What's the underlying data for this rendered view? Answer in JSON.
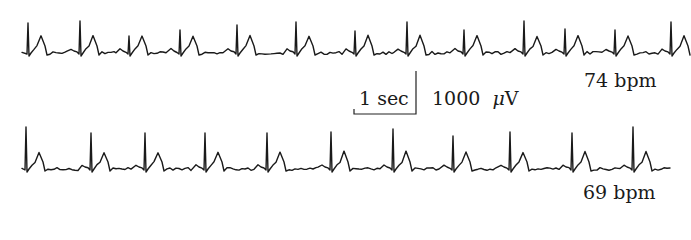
{
  "chart_data": {
    "type": "line",
    "title": "",
    "xlabel": "",
    "ylabel": "",
    "grid": false,
    "legend": null,
    "scale_bar": {
      "time_label": "1 sec",
      "amplitude_label": "1000 μV",
      "time_value": 1,
      "time_unit": "sec",
      "amplitude_value": 1000,
      "amplitude_unit": "μV"
    },
    "series": [
      {
        "name": "top trace",
        "heart_rate_label": "74 bpm",
        "heart_rate_bpm": 74,
        "baseline_y_px": 52,
        "x_range_px": [
          22,
          672
        ],
        "r_peaks_px": [
          {
            "x": 28,
            "y": 23
          },
          {
            "x": 80,
            "y": 21
          },
          {
            "x": 129,
            "y": 36
          },
          {
            "x": 180,
            "y": 30
          },
          {
            "x": 237,
            "y": 25
          },
          {
            "x": 296,
            "y": 22
          },
          {
            "x": 355,
            "y": 31
          },
          {
            "x": 407,
            "y": 22
          },
          {
            "x": 464,
            "y": 30
          },
          {
            "x": 524,
            "y": 21
          },
          {
            "x": 565,
            "y": 29
          },
          {
            "x": 615,
            "y": 30
          },
          {
            "x": 671,
            "y": 22
          }
        ]
      },
      {
        "name": "bottom trace",
        "heart_rate_label": "69 bpm",
        "heart_rate_bpm": 69,
        "baseline_y_px": 168,
        "x_range_px": [
          22,
          670
        ],
        "r_peaks_px": [
          {
            "x": 26,
            "y": 127
          },
          {
            "x": 91,
            "y": 133
          },
          {
            "x": 145,
            "y": 133
          },
          {
            "x": 205,
            "y": 133
          },
          {
            "x": 267,
            "y": 133
          },
          {
            "x": 331,
            "y": 132
          },
          {
            "x": 393,
            "y": 129
          },
          {
            "x": 453,
            "y": 136
          },
          {
            "x": 510,
            "y": 132
          },
          {
            "x": 572,
            "y": 133
          },
          {
            "x": 633,
            "y": 127
          }
        ]
      }
    ]
  },
  "labels": {
    "top_rate": "74 bpm",
    "bottom_rate": "69 bpm",
    "scale_time": "1 sec",
    "scale_amp_value": "1000",
    "scale_amp_unit_prefix": "μ",
    "scale_amp_unit": "V"
  },
  "scale_bar_geometry": {
    "left_x": 354,
    "right_x": 416,
    "bottom_y": 114,
    "top_y": 71,
    "tick_top_y": 109
  }
}
